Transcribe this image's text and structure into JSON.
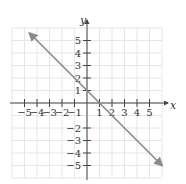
{
  "chart_data": {
    "type": "line",
    "title": "",
    "xlabel": "x",
    "ylabel": "y",
    "xlim": [
      -6,
      6
    ],
    "ylim": [
      -6,
      6
    ],
    "grid": true,
    "x_ticks": [
      -5,
      -4,
      -3,
      -2,
      -1,
      1,
      2,
      3,
      4,
      5
    ],
    "y_ticks": [
      5,
      4,
      3,
      2,
      1,
      -2,
      -3,
      -4,
      -5
    ],
    "x_tick_labels": [
      "−5",
      "−4",
      "−3",
      "−2",
      "−1",
      "1",
      "2",
      "3",
      "4",
      "5"
    ],
    "y_tick_labels": [
      "5",
      "4",
      "3",
      "2",
      "1",
      "−2",
      "−3",
      "−4",
      "−5"
    ],
    "series": [
      {
        "name": "y = -x + 1",
        "equation": "y = -x + 1",
        "slope": -1,
        "intercept": 1,
        "x": [
          -4.6,
          6
        ],
        "y": [
          5.6,
          -5
        ],
        "arrows": "both",
        "color": "#8a8a8a"
      }
    ]
  },
  "colors": {
    "grid": "#e6e6e6",
    "axis": "#444444",
    "line": "#8a8a8a"
  }
}
